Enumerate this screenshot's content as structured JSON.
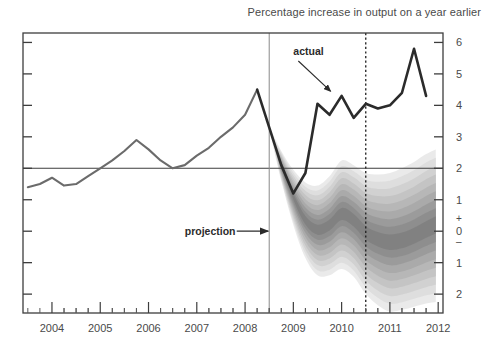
{
  "chart_data": {
    "type": "area",
    "title": "Percentage increase in output on a year earlier",
    "subtitle": "",
    "xlabel": "",
    "ylabel": "",
    "xlim": [
      2003.4,
      2012.1
    ],
    "ylim": [
      -2.6,
      6.3
    ],
    "grid": false,
    "legend_position": "none",
    "y_ticks": [
      {
        "value": 6,
        "label": "6"
      },
      {
        "value": 5,
        "label": "5"
      },
      {
        "value": 4,
        "label": "4"
      },
      {
        "value": 3,
        "label": "3"
      },
      {
        "value": 2,
        "label": "2"
      },
      {
        "value": 1,
        "label": "1"
      },
      {
        "value": 0,
        "label": "0"
      },
      {
        "value": -1,
        "label": "1"
      },
      {
        "value": -2,
        "label": "2"
      }
    ],
    "y_sign_plus": "+",
    "y_sign_minus": "–",
    "x_ticks": [
      "2004",
      "2005",
      "2006",
      "2007",
      "2008",
      "2009",
      "2010",
      "2011",
      "2012"
    ],
    "x_tick_values": [
      2004,
      2005,
      2006,
      2007,
      2008,
      2009,
      2010,
      2011,
      2012
    ],
    "x_minor_per_year": 4,
    "reference_line_value": 2,
    "reference_line_label": "2% target",
    "projection_start": 2008.5,
    "forecast_marker": 2010.5,
    "series": [
      {
        "name": "actual",
        "color": "#2b2b2b",
        "x": [
          2003.5,
          2003.75,
          2004.0,
          2004.25,
          2004.5,
          2004.75,
          2005.0,
          2005.25,
          2005.5,
          2005.75,
          2006.0,
          2006.25,
          2006.5,
          2006.75,
          2007.0,
          2007.25,
          2007.5,
          2007.75,
          2008.0,
          2008.25,
          2008.5,
          2008.75,
          2009.0,
          2009.25,
          2009.5,
          2009.75,
          2010.0,
          2010.25,
          2010.5,
          2010.75,
          2011.0,
          2011.25,
          2011.5,
          2011.75
        ],
        "values": [
          1.4,
          1.5,
          1.7,
          1.45,
          1.5,
          1.75,
          2.0,
          2.25,
          2.55,
          2.9,
          2.6,
          2.25,
          2.0,
          2.1,
          2.4,
          2.65,
          3.0,
          3.3,
          3.7,
          4.5,
          3.3,
          2.1,
          1.2,
          1.85,
          4.05,
          3.7,
          4.3,
          3.6,
          4.05,
          3.9,
          4.0,
          4.4,
          5.8,
          4.3
        ]
      }
    ],
    "fan": {
      "name": "projection",
      "description": "probability distribution fan, grayscale bands",
      "start": 2008.5,
      "end": 2011.95,
      "bands": [
        {
          "probability": 10,
          "shade": "#808080"
        },
        {
          "probability": 20,
          "shade": "#8d8d8d"
        },
        {
          "probability": 30,
          "shade": "#9a9a9a"
        },
        {
          "probability": 40,
          "shade": "#a8a8a8"
        },
        {
          "probability": 50,
          "shade": "#b5b5b5"
        },
        {
          "probability": 60,
          "shade": "#c2c2c2"
        },
        {
          "probability": 70,
          "shade": "#cfcfcf"
        },
        {
          "probability": 80,
          "shade": "#dcdcdc"
        },
        {
          "probability": 90,
          "shade": "#e8e8e8"
        }
      ],
      "x": [
        2008.5,
        2008.75,
        2009.0,
        2009.25,
        2009.5,
        2009.75,
        2010.0,
        2010.25,
        2010.5,
        2010.75,
        2011.0,
        2011.25,
        2011.5,
        2011.75,
        2011.95
      ],
      "central": [
        3.3,
        2.1,
        1.1,
        0.35,
        0.05,
        0.2,
        0.55,
        0.35,
        -0.05,
        -0.25,
        -0.35,
        -0.3,
        -0.15,
        0.05,
        0.2
      ],
      "upper_90": [
        3.35,
        2.55,
        1.95,
        1.55,
        1.45,
        1.75,
        2.25,
        2.1,
        1.85,
        1.8,
        1.85,
        2.0,
        2.2,
        2.45,
        2.6
      ],
      "lower_90": [
        3.25,
        1.6,
        0.2,
        -0.85,
        -1.4,
        -1.4,
        -1.2,
        -1.45,
        -2.0,
        -2.35,
        -2.55,
        -2.5,
        -2.4,
        -2.3,
        -2.25
      ]
    },
    "annotations": [
      {
        "name": "actual",
        "text": "actual",
        "text_x": 2009.0,
        "text_y": 5.6,
        "arrow_to_x": 2009.77,
        "arrow_to_y": 4.45
      },
      {
        "name": "projection",
        "text": "projection",
        "text_x": 2006.75,
        "text_y": 0.0,
        "arrow_to_x": 2008.5,
        "arrow_to_y": 0.0
      }
    ],
    "colors": {
      "actual_line": "#2b2b2b",
      "history_line": "#6b6b6b",
      "axis": "#3d3d3d",
      "reference_line": "#3d3d3d",
      "forecast_marker": "#1f1f1f",
      "projection_divider": "#8a8a8a",
      "background": "#ffffff"
    }
  }
}
